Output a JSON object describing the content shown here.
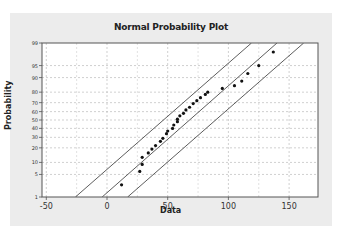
{
  "chart_data": {
    "type": "scatter",
    "title": "Normal Probability Plot",
    "xlabel": "Data",
    "ylabel": "Probability",
    "x_ticks": [
      "-50",
      "0",
      "50",
      "100",
      "150"
    ],
    "x_tick_values": [
      -50,
      0,
      50,
      100,
      150
    ],
    "y_ticks": [
      "1",
      "5",
      "10",
      "20",
      "30",
      "40",
      "50",
      "60",
      "70",
      "80",
      "90",
      "95",
      "99"
    ],
    "y_tick_values": [
      1,
      5,
      10,
      20,
      30,
      40,
      50,
      60,
      70,
      80,
      90,
      95,
      99
    ],
    "xlim": [
      -50,
      174
    ],
    "ylim": [
      1,
      99
    ],
    "y_scale": "normal-probability",
    "grid": true,
    "legend": null,
    "series": [
      {
        "name": "Data",
        "kind": "points",
        "x": [
          12,
          27,
          29,
          29,
          34,
          37,
          40,
          44,
          46,
          49,
          50,
          54,
          55,
          58,
          58,
          60,
          63,
          65,
          68,
          71,
          74,
          77,
          81,
          83,
          95,
          105,
          111,
          116,
          125,
          137
        ],
        "y": [
          2.5,
          6,
          9,
          13,
          16,
          19,
          22,
          26,
          29,
          34,
          37,
          40,
          44,
          48,
          51,
          55,
          58,
          62,
          65,
          69,
          72,
          75,
          78,
          80,
          83,
          85,
          88,
          92,
          95,
          98
        ]
      },
      {
        "name": "Fitted line",
        "kind": "line",
        "x": [
          -4,
          140
        ],
        "y": [
          1,
          99
        ]
      },
      {
        "name": "Upper confidence bound",
        "kind": "line",
        "x": [
          -26,
          119
        ],
        "y": [
          1,
          99
        ]
      },
      {
        "name": "Lower confidence bound",
        "kind": "line",
        "x": [
          17,
          162
        ],
        "y": [
          1,
          99
        ]
      }
    ]
  }
}
